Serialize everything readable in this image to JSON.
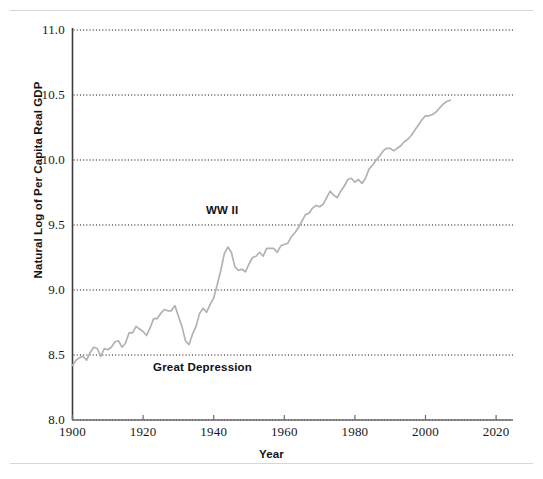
{
  "figure": {
    "type": "line-chart-figure",
    "background": "#ffffff",
    "rules": {
      "top": "horizontal-rule",
      "bottom": "horizontal-rule",
      "color": "#d8d6d4"
    }
  },
  "axis": {
    "xlabel": "Year",
    "ylabel": "Natural Log of Per Capita Real GDP",
    "yticks": [
      "8.0",
      "8.5",
      "9.0",
      "9.5",
      "10.0",
      "10.5",
      "11.0"
    ],
    "xticks": [
      "1900",
      "1920",
      "1940",
      "1960",
      "1980",
      "2000",
      "2020"
    ]
  },
  "annotations": {
    "wwii": "WW II",
    "great_depression": "Great Depression"
  },
  "colors": {
    "line": "#b2b2b2",
    "axis": "#3d3d3d",
    "grid": "#1a1a1a",
    "text": "#141416",
    "rule": "#d8d6d4"
  },
  "chart_data": {
    "type": "line",
    "title": "",
    "xlabel": "Year",
    "ylabel": "Natural Log of Per Capita Real GDP",
    "xlim": [
      1900,
      2022
    ],
    "ylim": [
      8.0,
      11.0
    ],
    "xticks": [
      1900,
      1920,
      1940,
      1960,
      1980,
      2000,
      2020
    ],
    "yticks": [
      8.0,
      8.5,
      9.0,
      9.5,
      10.0,
      10.5,
      11.0
    ],
    "grid": "horizontal-dotted",
    "legend": "none",
    "annotations": [
      {
        "text": "WW II",
        "x": 1943,
        "y": 9.62
      },
      {
        "text": "Great Depression",
        "x": 1932,
        "y": 8.38
      }
    ],
    "series": [
      {
        "name": "Natural Log of Per Capita Real GDP",
        "color": "#b2b2b2",
        "x": [
          1900,
          1901,
          1902,
          1903,
          1904,
          1905,
          1906,
          1907,
          1908,
          1909,
          1910,
          1911,
          1912,
          1913,
          1914,
          1915,
          1916,
          1917,
          1918,
          1919,
          1920,
          1921,
          1922,
          1923,
          1924,
          1925,
          1926,
          1927,
          1928,
          1929,
          1930,
          1931,
          1932,
          1933,
          1934,
          1935,
          1936,
          1937,
          1938,
          1939,
          1940,
          1941,
          1942,
          1943,
          1944,
          1945,
          1946,
          1947,
          1948,
          1949,
          1950,
          1951,
          1952,
          1953,
          1954,
          1955,
          1956,
          1957,
          1958,
          1959,
          1960,
          1961,
          1962,
          1963,
          1964,
          1965,
          1966,
          1967,
          1968,
          1969,
          1970,
          1971,
          1972,
          1973,
          1974,
          1975,
          1976,
          1977,
          1978,
          1979,
          1980,
          1981,
          1982,
          1983,
          1984,
          1985,
          1986,
          1987,
          1988,
          1989,
          1990,
          1991,
          1992,
          1993,
          1994,
          1995,
          1996,
          1997,
          1998,
          1999,
          2000,
          2001,
          2002,
          2003,
          2004,
          2005,
          2006,
          2007
        ],
        "y": [
          8.42,
          8.46,
          8.48,
          8.49,
          8.46,
          8.52,
          8.56,
          8.55,
          8.49,
          8.55,
          8.54,
          8.56,
          8.6,
          8.61,
          8.56,
          8.59,
          8.67,
          8.67,
          8.72,
          8.7,
          8.68,
          8.65,
          8.71,
          8.78,
          8.78,
          8.82,
          8.85,
          8.84,
          8.84,
          8.88,
          8.8,
          8.72,
          8.61,
          8.58,
          8.66,
          8.72,
          8.82,
          8.86,
          8.83,
          8.89,
          8.94,
          9.04,
          9.15,
          9.28,
          9.33,
          9.29,
          9.18,
          9.15,
          9.16,
          9.14,
          9.2,
          9.25,
          9.26,
          9.29,
          9.26,
          9.32,
          9.32,
          9.32,
          9.29,
          9.34,
          9.35,
          9.36,
          9.41,
          9.44,
          9.48,
          9.53,
          9.58,
          9.59,
          9.63,
          9.65,
          9.64,
          9.66,
          9.71,
          9.76,
          9.73,
          9.71,
          9.76,
          9.8,
          9.85,
          9.86,
          9.83,
          9.85,
          9.82,
          9.86,
          9.93,
          9.96,
          10.0,
          10.03,
          10.07,
          10.09,
          10.09,
          10.07,
          10.09,
          10.11,
          10.14,
          10.16,
          10.19,
          10.23,
          10.27,
          10.31,
          10.34,
          10.34,
          10.35,
          10.37,
          10.4,
          10.43,
          10.45,
          10.46
        ]
      }
    ]
  }
}
